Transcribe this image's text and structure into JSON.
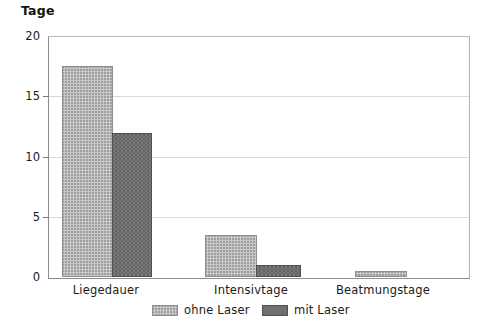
{
  "chart_data": {
    "type": "bar",
    "title": "",
    "ylabel": "Tage",
    "xlabel": "",
    "ylim": [
      0,
      20
    ],
    "yticks": [
      0,
      5,
      10,
      15,
      20
    ],
    "ytick_labels": [
      "0",
      "5",
      "10",
      "15",
      "20"
    ],
    "grid": true,
    "grid_axis": "y",
    "legend_position": "bottom-center",
    "categories": [
      "Liegedauer",
      "Intensivtage",
      "Beatmungstage"
    ],
    "series": [
      {
        "name": "ohne Laser",
        "color": "#c9c9c9",
        "pattern": "crosshatch",
        "values": [
          17.6,
          3.5,
          0.5
        ]
      },
      {
        "name": "mit Laser",
        "color": "#6f6f6f",
        "pattern": "solid",
        "values": [
          12.0,
          1.0,
          0.0
        ]
      }
    ]
  },
  "axis": {
    "y_title": "Tage"
  },
  "legend": {
    "entries": [
      {
        "label": "ohne Laser"
      },
      {
        "label": "mit Laser"
      }
    ]
  }
}
